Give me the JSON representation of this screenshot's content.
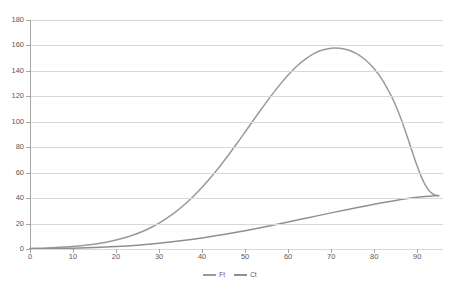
{
  "chart_data": {
    "type": "line",
    "title": "",
    "subtitle": "",
    "xlabel": "",
    "ylabel": "",
    "xlim": [
      0,
      96
    ],
    "ylim": [
      0,
      180
    ],
    "ytick_step": 20,
    "xtick_step": 10,
    "grid": "horizontal-only",
    "legend_position": "bottom-center",
    "ticks": {
      "y": [
        "0",
        "20",
        "40",
        "60",
        "80",
        "100",
        "120",
        "140",
        "160",
        "180"
      ],
      "x": [
        "0",
        "10",
        "20",
        "30",
        "40",
        "50",
        "60",
        "70",
        "80",
        "90"
      ]
    },
    "colors": {
      "series_ft": "#9a9a9a",
      "series_ct": "#8f8f8f",
      "gridline": "#d9d9d9",
      "axis": "#a6a6a6",
      "tick_text": "#595959",
      "background": "#ffffff"
    },
    "series": [
      {
        "name": "Ft",
        "color": "#9a9a9a",
        "x": [
          0,
          2,
          4,
          6,
          8,
          10,
          12,
          14,
          16,
          18,
          20,
          22,
          24,
          26,
          28,
          30,
          32,
          34,
          36,
          38,
          40,
          42,
          44,
          46,
          48,
          50,
          52,
          54,
          56,
          58,
          60,
          62,
          64,
          66,
          68,
          70,
          72,
          74,
          76,
          78,
          80,
          82,
          84,
          85,
          86,
          87,
          88,
          89,
          90,
          91,
          92,
          93,
          94,
          95
        ],
        "values": [
          0.4,
          0.6,
          0.8,
          1.1,
          1.5,
          2.0,
          2.6,
          3.4,
          4.3,
          5.5,
          7.0,
          8.8,
          11.0,
          13.6,
          16.7,
          20.4,
          24.7,
          29.6,
          35.2,
          41.5,
          48.5,
          56.2,
          64.5,
          73.3,
          82.5,
          92.0,
          101.6,
          111.0,
          120.2,
          128.8,
          136.7,
          143.6,
          149.3,
          153.6,
          156.4,
          157.8,
          157.8,
          156.4,
          153.4,
          148.6,
          141.7,
          132.4,
          120.2,
          112.8,
          104.5,
          95.2,
          85.2,
          75.0,
          65.2,
          56.5,
          49.6,
          45.0,
          42.6,
          41.8
        ]
      },
      {
        "name": "Ct",
        "color": "#8f8f8f",
        "x": [
          0,
          5,
          10,
          15,
          20,
          25,
          30,
          35,
          40,
          45,
          50,
          55,
          60,
          65,
          70,
          75,
          80,
          85,
          90,
          95
        ],
        "values": [
          0.1,
          0.3,
          0.6,
          1.1,
          1.9,
          3.0,
          4.5,
          6.4,
          8.7,
          11.4,
          14.4,
          17.7,
          21.2,
          24.8,
          28.4,
          31.9,
          35.2,
          38.2,
          40.6,
          42.0
        ]
      }
    ],
    "legend": [
      {
        "label": "Ft",
        "color": "#9a9a9a"
      },
      {
        "label": "Ct",
        "color": "#8f8f8f"
      }
    ],
    "annotations": {
      "ft_peak_value": 158,
      "ft_peak_x": 84,
      "crossing_x": 95,
      "crossing_value": 42
    }
  }
}
